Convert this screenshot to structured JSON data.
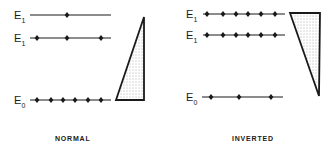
{
  "colors": {
    "ink": "#1a1a1a",
    "background": "#ffffff"
  },
  "panels": [
    {
      "id": "normal",
      "caption": "NORMAL",
      "caption_pos": [
        55,
        141
      ],
      "levels": [
        {
          "label": "E",
          "sub": "1",
          "y": 15,
          "x1": 30,
          "x2": 111,
          "label_x": 14,
          "dots": [
            67
          ]
        },
        {
          "label": "E",
          "sub": "1",
          "y": 38,
          "x1": 30,
          "x2": 111,
          "label_x": 14,
          "dots": [
            37,
            67,
            101
          ]
        },
        {
          "label": "E",
          "sub": "0",
          "y": 100,
          "x1": 30,
          "x2": 111,
          "label_x": 14,
          "dots": [
            37,
            51,
            63,
            75,
            88,
            101
          ]
        }
      ],
      "triangle": [
        [
          144,
          17
        ],
        [
          116,
          100
        ],
        [
          144,
          100
        ]
      ]
    },
    {
      "id": "inverted",
      "caption": "INVERTED",
      "caption_pos": [
        232,
        141
      ],
      "levels": [
        {
          "label": "E",
          "sub": "1",
          "y": 14,
          "x1": 203,
          "x2": 285,
          "label_x": 186,
          "dots": [
            207,
            223,
            236,
            248,
            261,
            275
          ]
        },
        {
          "label": "E",
          "sub": "1",
          "y": 35,
          "x1": 203,
          "x2": 285,
          "label_x": 186,
          "dots": [
            207,
            223,
            236,
            248,
            261,
            275
          ]
        },
        {
          "label": "E",
          "sub": "0",
          "y": 97,
          "x1": 202,
          "x2": 283,
          "label_x": 186,
          "dots": [
            211,
            239,
            271
          ]
        }
      ],
      "triangle": [
        [
          290,
          13
        ],
        [
          320,
          13
        ],
        [
          319,
          96
        ]
      ]
    }
  ]
}
